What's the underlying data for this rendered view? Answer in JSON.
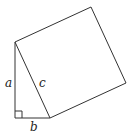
{
  "diagram": {
    "vertices": {
      "right_angle": [
        15,
        118
      ],
      "top": [
        15,
        42
      ],
      "bottom_right": [
        50,
        118
      ],
      "square_top": [
        91,
        7
      ],
      "square_right": [
        126,
        83
      ]
    },
    "labels": {
      "leg_vertical": "a",
      "leg_horizontal": "b",
      "hypotenuse": "c"
    },
    "stroke_color": "#333333"
  }
}
